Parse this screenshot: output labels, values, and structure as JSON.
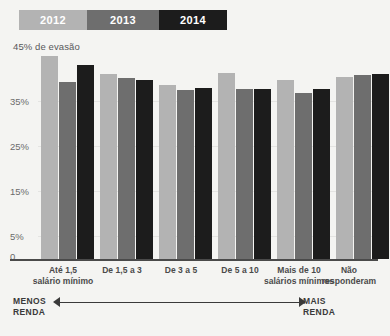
{
  "legend": {
    "items": [
      {
        "label": "2012",
        "color": "#b3b3b3"
      },
      {
        "label": "2013",
        "color": "#6e6e6e"
      },
      {
        "label": "2014",
        "color": "#1c1c1c"
      }
    ]
  },
  "axis_note": "45% de evasão",
  "yticks": [
    {
      "label": "45%"
    },
    {
      "label": "35%"
    },
    {
      "label": "25%"
    },
    {
      "label": "15%"
    },
    {
      "label": "5%"
    },
    {
      "label": "0"
    }
  ],
  "xlabels": [
    {
      "line1": "Até 1,5",
      "line2": "salário mínimo"
    },
    {
      "line1": "De 1,5 a 3",
      "line2": ""
    },
    {
      "line1": "De 3 a 5",
      "line2": ""
    },
    {
      "line1": "De 5 a 10",
      "line2": ""
    },
    {
      "line1": "Mais de 10",
      "line2": "salários mínimos"
    },
    {
      "line1": "Não",
      "line2": "responderam"
    }
  ],
  "annotation": {
    "left_line1": "MENOS",
    "left_line2": "RENDA",
    "right_line1": "MAIS",
    "right_line2": "RENDA"
  },
  "chart_data": {
    "type": "bar",
    "title": "",
    "subtitle": "",
    "xlabel": "",
    "ylabel": "45% de evasão",
    "ylim": [
      0,
      47
    ],
    "ytick_values": [
      45,
      35,
      25,
      15,
      5,
      0
    ],
    "grid": true,
    "legend_position": "top-left",
    "categories": [
      "Até 1,5 salário mínimo",
      "De 1,5 a 3",
      "De 3 a 5",
      "De 5 a 10",
      "Mais de 10 salários mínimos",
      "Não responderam"
    ],
    "series": [
      {
        "name": "2012",
        "color": "#b3b3b3",
        "values": [
          44.8,
          40.8,
          38.3,
          41.0,
          39.5,
          40.2
        ]
      },
      {
        "name": "2013",
        "color": "#6e6e6e",
        "values": [
          39.0,
          40.0,
          37.2,
          37.5,
          36.6,
          40.6
        ]
      },
      {
        "name": "2014",
        "color": "#1c1c1c",
        "values": [
          42.8,
          39.4,
          37.7,
          37.6,
          37.6,
          40.8
        ]
      }
    ]
  }
}
